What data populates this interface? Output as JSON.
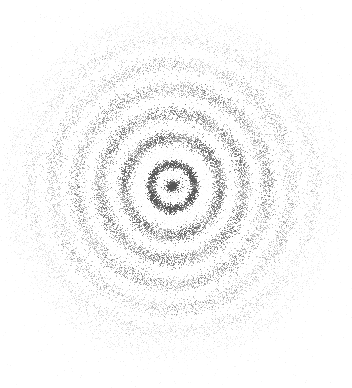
{
  "figure": {
    "title": "",
    "background_color": "#ffffff",
    "width": 352,
    "height": 388,
    "point_color": "#555555",
    "axes_visible": false,
    "grid_visible": false,
    "legend_visible": false,
    "frame_visible": false,
    "canvas_label": "concentric-ring-point-scatter"
  },
  "chart_data": {
    "type": "scatter",
    "title": "",
    "subtitle": "",
    "xlabel": "",
    "ylabel": "",
    "xlim": [
      0,
      352
    ],
    "ylim": [
      0,
      388
    ],
    "grid": false,
    "legend_position": "none",
    "marker": {
      "shape": "point",
      "size_px": 1,
      "color": "#555555",
      "base_opacity": 0.85
    },
    "center": {
      "x": 172,
      "y": 186
    },
    "annotations": [
      {
        "name": "dense-core-cluster",
        "x": 172,
        "y": 186,
        "radius_px": 7,
        "n_points": 520,
        "opacity": 0.95,
        "description": "very dark compact blob of points at the exact center"
      }
    ],
    "series": [
      {
        "name": "ring-1",
        "radius": 22,
        "thickness": 5,
        "n_points": 2100,
        "opacity": 0.7,
        "density": "high"
      },
      {
        "name": "ring-2",
        "radius": 48,
        "thickness": 8,
        "n_points": 3200,
        "opacity": 0.52,
        "density": "high"
      },
      {
        "name": "ring-3",
        "radius": 72,
        "thickness": 9,
        "n_points": 3600,
        "opacity": 0.46,
        "density": "medium-high"
      },
      {
        "name": "ring-4",
        "radius": 96,
        "thickness": 10,
        "n_points": 3800,
        "opacity": 0.38,
        "density": "medium"
      },
      {
        "name": "ring-5",
        "radius": 120,
        "thickness": 11,
        "n_points": 3700,
        "opacity": 0.28,
        "density": "medium-low"
      },
      {
        "name": "ring-6",
        "radius": 143,
        "thickness": 12,
        "n_points": 3200,
        "opacity": 0.18,
        "density": "low"
      },
      {
        "name": "ring-7",
        "radius": 162,
        "thickness": 13,
        "n_points": 2200,
        "opacity": 0.1,
        "density": "very-low"
      },
      {
        "name": "background-haze",
        "radius": 90,
        "thickness": 170,
        "n_points": 4200,
        "opacity": 0.06,
        "density": "sparse-fill"
      }
    ]
  }
}
